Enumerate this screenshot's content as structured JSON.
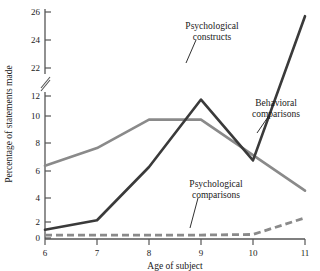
{
  "chart_data": {
    "type": "line",
    "title": "",
    "xlabel": "Age of subject",
    "ylabel": "Percentage of statements made",
    "x": [
      6,
      7,
      8,
      9,
      10,
      11
    ],
    "xticklabels": [
      "6",
      "7",
      "8",
      "9",
      "10",
      "11"
    ],
    "xlim": [
      6,
      11
    ],
    "ylim": [
      0,
      26
    ],
    "yticks": [
      0,
      2,
      4,
      6,
      8,
      10,
      12,
      22,
      24,
      26
    ],
    "yticklabels": [
      "0",
      "2",
      "4",
      "6",
      "8",
      "10",
      "12",
      "22",
      "24",
      "26"
    ],
    "axis_break": {
      "between": [
        12,
        22
      ],
      "style": "double-slash"
    },
    "grid": false,
    "legend": "inline-annotations",
    "series": [
      {
        "name": "Psychological constructs",
        "values": [
          0.7,
          1.5,
          6.0,
          11.7,
          15.4,
          25.7
        ],
        "color": "#3a3a3a",
        "style": "solid",
        "label_x": 212,
        "label_y": 30,
        "leader": {
          "x1": 196,
          "y1": 40,
          "x2": 186,
          "y2": 63
        }
      },
      {
        "name": "Behavioral comparisons",
        "values": [
          6.1,
          7.6,
          10.0,
          10.0,
          7.0,
          4.0
        ],
        "color": "#8a8a8a",
        "style": "solid",
        "label_x": 276,
        "label_y": 107,
        "leader": {
          "x1": 268,
          "y1": 117,
          "x2": 258,
          "y2": 133
        }
      },
      {
        "name": "Psychological comparisons",
        "values": [
          0.25,
          0.25,
          0.25,
          0.25,
          0.3,
          1.7
        ],
        "color": "#8a8a8a",
        "style": "dashed",
        "label_x": 216,
        "label_y": 187,
        "leader": {
          "x1": 198,
          "y1": 198,
          "x2": 190,
          "y2": 226
        }
      }
    ],
    "axis_color": "#555555",
    "text_color": "#1a1a1a"
  },
  "labels": {
    "ylabel": "Percentage of statements made",
    "xlabel": "Age of subject",
    "series_1_line1": "Psychological",
    "series_1_line2": "constructs",
    "series_2_line1": "Behavioral",
    "series_2_line2": "comparisons",
    "series_3_line1": "Psychological",
    "series_3_line2": "comparisons",
    "y_0": "0",
    "y_2": "2",
    "y_4": "4",
    "y_6": "6",
    "y_8": "8",
    "y_10": "10",
    "y_12": "12",
    "y_22": "22",
    "y_24": "24",
    "y_26": "26",
    "x_6": "6",
    "x_7": "7",
    "x_8": "8",
    "x_9": "9",
    "x_10": "10",
    "x_11": "11"
  }
}
